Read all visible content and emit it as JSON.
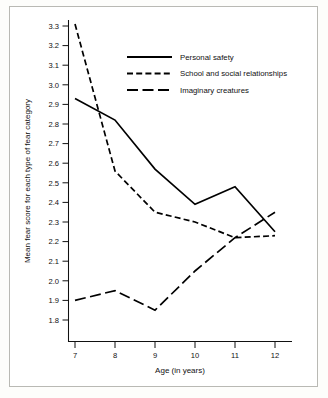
{
  "chart_data": {
    "type": "line",
    "title": "",
    "xlabel": "Age (in years)",
    "ylabel": "Mean fear score for each type of fear category",
    "x": [
      7,
      8,
      9,
      10,
      11,
      12
    ],
    "xticklabels": [
      "7",
      "8",
      "9",
      "10",
      "11",
      "12"
    ],
    "xlim": [
      6.6,
      12.4
    ],
    "ylim": [
      1.75,
      3.35
    ],
    "yticks": [
      1.8,
      1.9,
      2.0,
      2.1,
      2.2,
      2.3,
      2.4,
      2.5,
      2.6,
      2.7,
      2.8,
      2.9,
      3.0,
      3.1,
      3.2,
      3.3
    ],
    "yticklabels": [
      "1.8",
      "1.9",
      "2.0",
      "2.1",
      "2.2",
      "2.3",
      "2.4",
      "2.5",
      "2.6",
      "2.7",
      "2.8",
      "2.9",
      "3.0",
      "3.1",
      "3.2",
      "3.3"
    ],
    "grid": false,
    "legend_position": "upper-center",
    "series": [
      {
        "name": "Personal safety",
        "style": "solid",
        "values": [
          2.93,
          2.82,
          2.57,
          2.39,
          2.48,
          2.25
        ]
      },
      {
        "name": "School and social relationships",
        "style": "dashed",
        "values": [
          3.31,
          2.56,
          2.35,
          2.3,
          2.22,
          2.23
        ]
      },
      {
        "name": "Imaginary creatures",
        "style": "long-dashed",
        "values": [
          1.9,
          1.95,
          1.85,
          2.05,
          2.22,
          2.35
        ]
      }
    ]
  },
  "colors": {
    "line": "#000000",
    "text": "#111111",
    "frame": "#b9b9b4",
    "background": "#ffffff"
  }
}
